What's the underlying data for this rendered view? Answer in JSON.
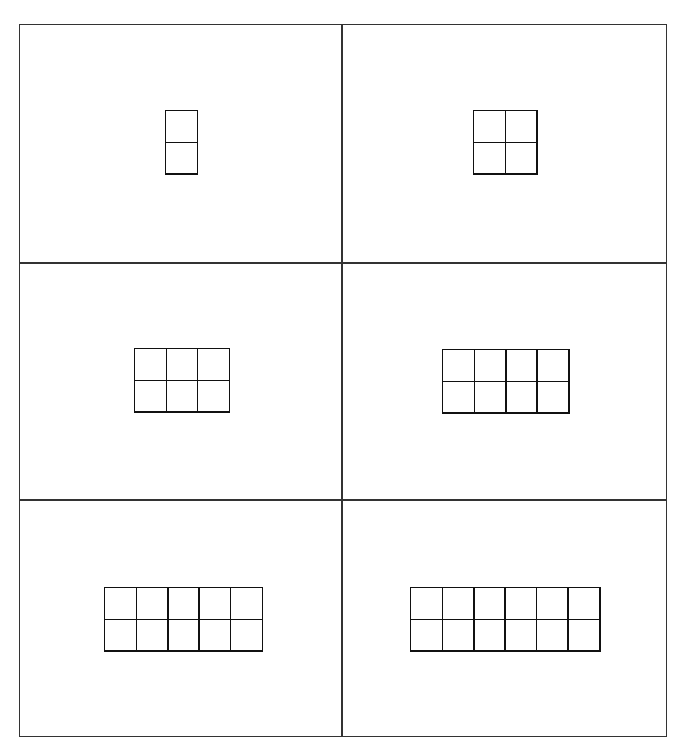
{
  "cards": [
    {
      "cols": 1,
      "rows": 2,
      "left": 165,
      "top": 110
    },
    {
      "cols": 2,
      "rows": 2,
      "left": 473,
      "top": 110
    },
    {
      "cols": 3,
      "rows": 2,
      "left": 134,
      "top": 348
    },
    {
      "cols": 4,
      "rows": 2,
      "left": 442,
      "top": 349
    },
    {
      "cols": 5,
      "rows": 2,
      "left": 104,
      "top": 587
    },
    {
      "cols": 6,
      "rows": 2,
      "left": 410,
      "top": 587
    }
  ],
  "cell_size": 31.5,
  "line_color": "#111111",
  "grid": {
    "columns": 2,
    "rows": 3
  }
}
